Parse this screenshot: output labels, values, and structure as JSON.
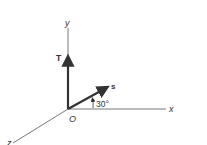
{
  "diagram": {
    "type": "3d-coordinate-vector-diagram",
    "axes": {
      "x_label": "x",
      "y_label": "y",
      "z_label": "z",
      "origin_label": "O"
    },
    "vectors": [
      {
        "name": "T",
        "label": "T",
        "direction": "along +y axis"
      },
      {
        "name": "s",
        "label": "s",
        "direction": "in x-y plane, 30° above x axis"
      }
    ],
    "angle": {
      "label": "30°",
      "between": [
        "s",
        "x"
      ]
    },
    "colors": {
      "axis": "#555555",
      "vector": "#333333",
      "text": "#333333",
      "background": "#ffffff"
    }
  }
}
